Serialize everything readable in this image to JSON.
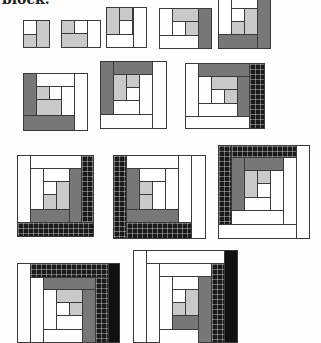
{
  "document": {
    "caption_fragment": "block.",
    "subject": "Log cabin quilt block construction sequence",
    "colors": {
      "white": "#fdfdfd",
      "light_gray": "#c9c9c9",
      "medium_gray": "#777777",
      "dark_grid": "#1a1a1a",
      "black": "#111111",
      "outline": "#3a3a3a"
    },
    "steps": [
      {
        "step": 1,
        "row": 1
      },
      {
        "step": 2,
        "row": 1
      },
      {
        "step": 3,
        "row": 1
      },
      {
        "step": 4,
        "row": 1
      },
      {
        "step": 5,
        "row": 1
      },
      {
        "step": 6,
        "row": 2
      },
      {
        "step": 7,
        "row": 2
      },
      {
        "step": 8,
        "row": 2
      },
      {
        "step": 9,
        "row": 3
      },
      {
        "step": 10,
        "row": 3
      },
      {
        "step": 11,
        "row": 3
      },
      {
        "step": 12,
        "row": 4
      },
      {
        "step": 13,
        "row": 4
      }
    ]
  }
}
